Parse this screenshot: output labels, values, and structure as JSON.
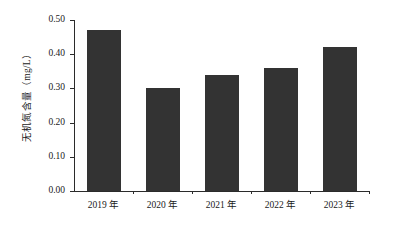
{
  "chart_data": {
    "type": "bar",
    "title": "",
    "xlabel": "",
    "ylabel": "无机氮含量（mg/L）",
    "categories": [
      "2019 年",
      "2020 年",
      "2021 年",
      "2022 年",
      "2023 年"
    ],
    "values": [
      0.47,
      0.3,
      0.34,
      0.36,
      0.42
    ],
    "series": [
      {
        "name": "无机氮含量",
        "values": [
          0.47,
          0.3,
          0.34,
          0.36,
          0.42
        ]
      }
    ],
    "ylim": [
      0.0,
      0.5
    ],
    "ytick_values": [
      0.0,
      0.1,
      0.2,
      0.3,
      0.4,
      0.5
    ],
    "ytick_labels": [
      "0.00",
      "0.10",
      "0.20",
      "0.30",
      "0.40",
      "0.50"
    ],
    "grid": false,
    "legend": "none",
    "bar_color": "#333333",
    "axis_color": "#2b2b2b",
    "background_color": "#ffffff",
    "units": "mg/L"
  }
}
